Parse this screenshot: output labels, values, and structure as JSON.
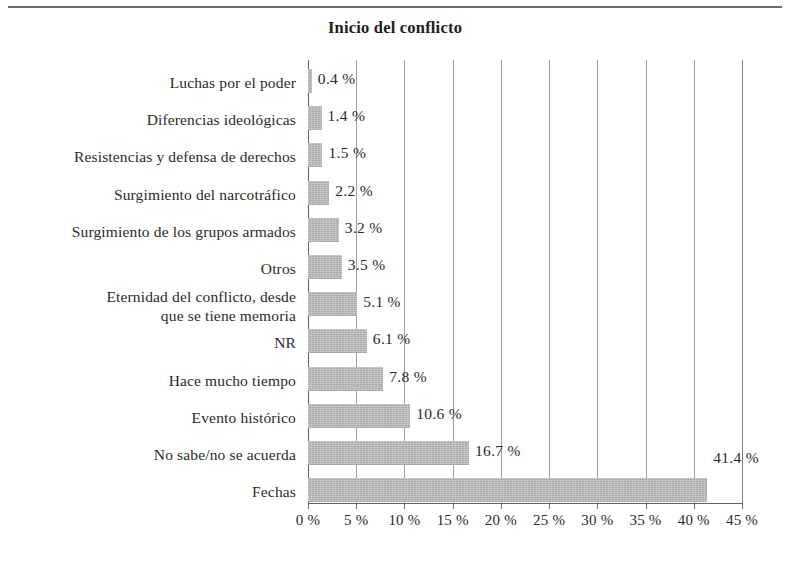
{
  "figure": {
    "title": "Inicio del conflicto",
    "rule_visible": true
  },
  "chart_data": {
    "type": "bar",
    "orientation": "horizontal",
    "title": "Inicio del conflicto",
    "xlabel": "",
    "ylabel": "",
    "xlim": [
      0,
      45
    ],
    "grid": true,
    "legend": null,
    "value_suffix": "%",
    "xticks": [
      "0 %",
      "5 %",
      "10 %",
      "15 %",
      "20 %",
      "25 %",
      "30 %",
      "35 %",
      "40 %",
      "45 %"
    ],
    "xtick_values": [
      0,
      5,
      10,
      15,
      20,
      25,
      30,
      35,
      40,
      45
    ],
    "categories": [
      "Luchas por el poder",
      "Diferencias ideológicas",
      "Resistencias y defensa de derechos",
      "Surgimiento del narcotráfico",
      "Surgimiento de los grupos armados",
      "Otros",
      "Eternidad del conflicto, desde\nque se tiene memoria",
      "NR",
      "Hace mucho tiempo",
      "Evento histórico",
      "No sabe/no se acuerda",
      "Fechas"
    ],
    "values": [
      0.4,
      1.4,
      1.5,
      2.2,
      3.2,
      3.5,
      5.1,
      6.1,
      7.8,
      10.6,
      16.7,
      41.4
    ],
    "value_labels": [
      "0.4 %",
      "1.4 %",
      "1.5 %",
      "2.2 %",
      "3.2 %",
      "3.5  %",
      "5.1 %",
      "6.1 %",
      "7.8 %",
      "10.6 %",
      "16.7 %",
      "41.4 %"
    ],
    "label_positions": [
      "right",
      "right",
      "right",
      "right",
      "right",
      "right",
      "right",
      "right",
      "right",
      "right",
      "right",
      "above"
    ],
    "bar_color": "#bcbcbc",
    "grid_color": "#9aa0a4",
    "axis_color": "#5d6265",
    "text_color": "#2a2a2a"
  }
}
